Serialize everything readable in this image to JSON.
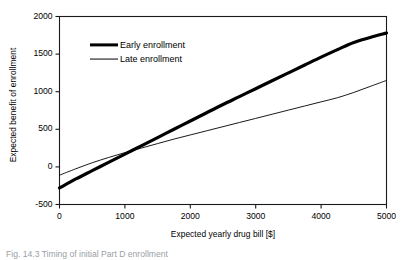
{
  "chart_data": {
    "type": "line",
    "title": "",
    "xlabel": "Expected yearly drug bill [$]",
    "ylabel": "Expected benefit of enrollment",
    "xlim": [
      0,
      5000
    ],
    "ylim": [
      -500,
      2000
    ],
    "xticks": [
      "0",
      "1000",
      "2000",
      "3000",
      "4000",
      "5000"
    ],
    "xtick_values": [
      0,
      1000,
      2000,
      3000,
      4000,
      5000
    ],
    "yticks": [
      "2000",
      "1500",
      "1000",
      "500",
      "0",
      "-500"
    ],
    "ytick_values": [
      2000,
      1500,
      1000,
      500,
      0,
      -500
    ],
    "grid": false,
    "legend_position": "upper-left-inside",
    "x": [
      0,
      250,
      500,
      750,
      1000,
      1250,
      1500,
      1750,
      2000,
      2250,
      2500,
      2750,
      3000,
      3250,
      3500,
      3750,
      4000,
      4250,
      4500,
      4750,
      5000
    ],
    "series": [
      {
        "name": "Early enrollment",
        "style": "thick",
        "color": "#000000",
        "linewidth": 3.2,
        "values": [
          -280,
          -160,
          -50,
          60,
          170,
          280,
          390,
          500,
          610,
          720,
          830,
          935,
          1040,
          1145,
          1250,
          1355,
          1460,
          1560,
          1655,
          1720,
          1780
        ]
      },
      {
        "name": "Late enrollment",
        "style": "thin",
        "color": "#000000",
        "linewidth": 0.9,
        "values": [
          -110,
          -25,
          55,
          125,
          190,
          250,
          310,
          370,
          425,
          480,
          535,
          590,
          645,
          700,
          755,
          810,
          865,
          920,
          990,
          1070,
          1150
        ]
      }
    ],
    "annotations": []
  },
  "legend": {
    "items": [
      {
        "label": "Early enrollment",
        "style": "thick"
      },
      {
        "label": "Late enrollment",
        "style": "thin"
      }
    ]
  },
  "caption": {
    "text": "Fig. 14.3   Timing of initial Part D enrollment"
  },
  "colors": {
    "axis": "#1a1a1a",
    "line": "#000000",
    "background": "#ffffff",
    "caption": "#9aa0a6"
  }
}
